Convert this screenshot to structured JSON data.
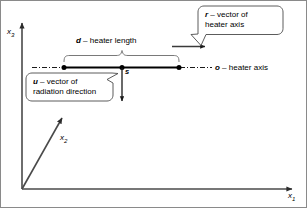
{
  "figure": {
    "type": "technical-diagram",
    "background_color": "#ffffff",
    "line_color": "#000000",
    "border_color": "#8a8a8a"
  },
  "axes": {
    "vertical": {
      "label": "x",
      "subscript": "3"
    },
    "oblique": {
      "label": "x",
      "subscript": "2"
    },
    "horizontal": {
      "label": "x",
      "subscript": "1"
    }
  },
  "points": {
    "midpoint": {
      "label": "s"
    }
  },
  "annotations": {
    "heater_length": {
      "symbol": "d",
      "separator": " – ",
      "text": "heater length"
    },
    "heater_axis": {
      "symbol": "o",
      "separator": " – ",
      "text": "heater axis"
    }
  },
  "callouts": [
    {
      "id": "r-vector",
      "symbol": "r",
      "separator": " – ",
      "line1": "vector of",
      "line2": "heater axis"
    },
    {
      "id": "u-vector",
      "symbol": "u",
      "separator": " – ",
      "line1": "vector of",
      "line2": "radiation direction"
    }
  ]
}
